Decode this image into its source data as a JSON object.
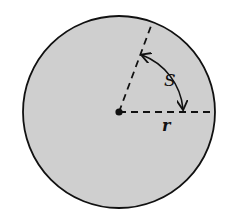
{
  "figure": {
    "type": "circle-sector-arc",
    "labels": {
      "arc": "S",
      "radius": "r"
    },
    "colors": {
      "fill": "#cfcfcf",
      "stroke": "#111111",
      "background": "#ffffff"
    }
  }
}
